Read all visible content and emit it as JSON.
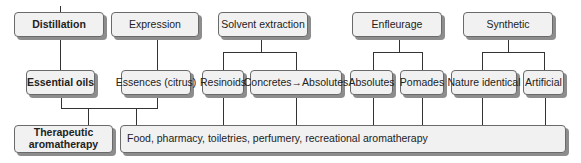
{
  "diagram": {
    "methods": [
      {
        "label": "Distillation",
        "bold": true
      },
      {
        "label": "Expression",
        "bold": false
      },
      {
        "label": "Solvent extraction",
        "bold": false
      },
      {
        "label": "Enfleurage",
        "bold": false
      },
      {
        "label": "Synthetic",
        "bold": false
      }
    ],
    "products": [
      {
        "label": "Essential oils",
        "bold": true
      },
      {
        "label": "Essences (citrus)",
        "bold": false
      },
      {
        "label": "Resinoids",
        "bold": false
      },
      {
        "label": "Concretes→Absolutes",
        "bold": false
      },
      {
        "label": "Absolutes",
        "bold": false
      },
      {
        "label": "Pomades",
        "bold": false
      },
      {
        "label": "Nature identical",
        "bold": false
      },
      {
        "label": "Artificial",
        "bold": false
      }
    ],
    "uses": [
      {
        "label": "Therapeutic aromatherapy",
        "line1": "Therapeutic",
        "line2": "aromatherapy",
        "bold": true
      },
      {
        "label": "Food, pharmacy, toiletries, perfumery, recreational aromatherapy",
        "bold": false
      }
    ]
  }
}
